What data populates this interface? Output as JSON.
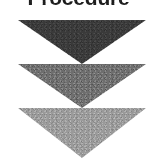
{
  "figure": {
    "width": 157,
    "height": 165,
    "background_color": "#ffffff",
    "texture": "scanned-halftone-grain"
  },
  "title": {
    "text": "Procedure",
    "color": "#1d1d1d",
    "weight": "bold",
    "clipped": "top of text cut off by image edge"
  },
  "diagram": {
    "kind": "stacked downward arrows",
    "arrow_count": 3,
    "direction": "down",
    "arrows": [
      {
        "index": 1,
        "label": "",
        "shade_name": "dark-gray",
        "color": "#3a3a3a",
        "left": 18,
        "top": 20,
        "width": 128,
        "height": 44
      },
      {
        "index": 2,
        "label": "",
        "shade_name": "medium-gray",
        "color": "#6e6e6e",
        "left": 18,
        "top": 64,
        "width": 128,
        "height": 44
      },
      {
        "index": 3,
        "label": "",
        "shade_name": "light-gray",
        "color": "#9a9a9a",
        "left": 18,
        "top": 108,
        "width": 128,
        "height": 50
      }
    ]
  },
  "chart_data": {
    "type": "diagram",
    "title": "Procedure",
    "shape": "inverted-triangle",
    "series": [
      {
        "name": "step-1",
        "shade": "#3a3a3a"
      },
      {
        "name": "step-2",
        "shade": "#6e6e6e"
      },
      {
        "name": "step-3",
        "shade": "#9a9a9a"
      }
    ]
  }
}
